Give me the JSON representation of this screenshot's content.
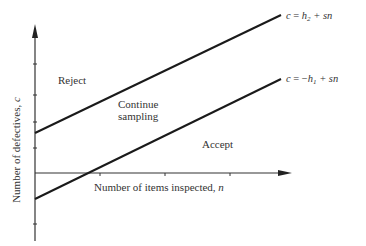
{
  "diagram": {
    "type": "sequential-sampling-plan",
    "axes": {
      "x_label": "Number of items inspected, ",
      "x_var": "n",
      "y_label": "Number of defectives, ",
      "y_var": "c"
    },
    "regions": {
      "reject": "Reject",
      "continue_line1": "Continue",
      "continue_line2": "sampling",
      "accept": "Accept"
    },
    "lines": {
      "upper": {
        "lhs": "c",
        "eq": " = ",
        "h": "h",
        "h_sub": "2",
        "rest": " + sn",
        "sign": ""
      },
      "lower": {
        "lhs": "c",
        "eq": " = ",
        "sign": "−",
        "h": "h",
        "h_sub": "1",
        "rest": " + sn"
      }
    },
    "colors": {
      "line": "#1a1a1a",
      "axis": "#333333",
      "text": "#333333"
    }
  }
}
